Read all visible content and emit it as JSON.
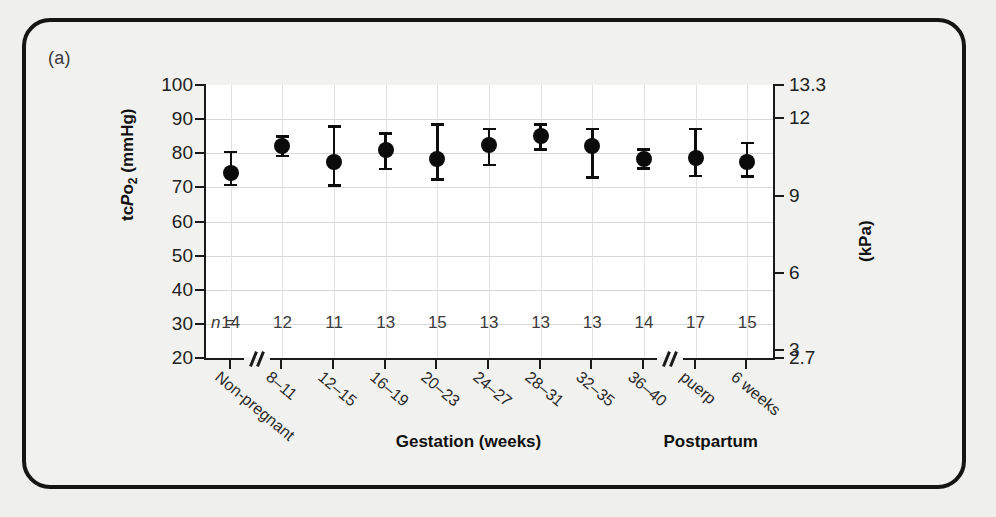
{
  "figure": {
    "panel_label": "(a)",
    "background_color": "#efefed",
    "frame_color": "#151515"
  },
  "chart_data": {
    "type": "scatter",
    "title": "",
    "xlabel": "",
    "ylabel": "tcPo2 (mmHg)",
    "y2label": "(kPa)",
    "ylim": [
      20,
      100
    ],
    "y2lim": [
      2.7,
      13.3
    ],
    "yticks": [
      20,
      30,
      40,
      50,
      60,
      70,
      80,
      90,
      100
    ],
    "ytick_labels": [
      "20",
      "30",
      "40",
      "50",
      "60",
      "70",
      "80",
      "90",
      "100"
    ],
    "y2ticks": [
      2.7,
      3,
      6,
      9,
      12,
      13.3
    ],
    "y2tick_labels": [
      "2.7",
      "3",
      "6",
      "9",
      "12",
      "13.3"
    ],
    "grid": true,
    "legend": "none",
    "categories": [
      "Non-pregnant",
      "8–11",
      "12–15",
      "16–19",
      "20–23",
      "24–27",
      "28–31",
      "32–35",
      "36–40",
      "puerp",
      "6 weeks"
    ],
    "values": [
      74.3,
      82.2,
      77.3,
      81.0,
      78.2,
      82.3,
      85.0,
      82.2,
      78.3,
      78.5,
      77.3
    ],
    "err_low": [
      70.3,
      78.8,
      70.2,
      75.0,
      72.0,
      76.2,
      80.7,
      72.5,
      75.2,
      73.0,
      72.8
    ],
    "err_high": [
      80.8,
      85.3,
      88.2,
      86.2,
      88.8,
      87.5,
      88.8,
      87.5,
      81.5,
      87.5,
      83.3
    ],
    "n_label_prefix": "n =",
    "n_values": [
      "14",
      "12",
      "11",
      "13",
      "15",
      "13",
      "13",
      "13",
      "14",
      "17",
      "15"
    ],
    "axis_breaks_after": [
      "Non-pregnant",
      "36–40"
    ],
    "group_labels": [
      {
        "text": "Gestation (weeks)",
        "position": "center-left"
      },
      {
        "text": "Postpartum",
        "position": "center-right"
      }
    ],
    "marker_color": "#0b0b0b",
    "marker_shape": "circle"
  }
}
